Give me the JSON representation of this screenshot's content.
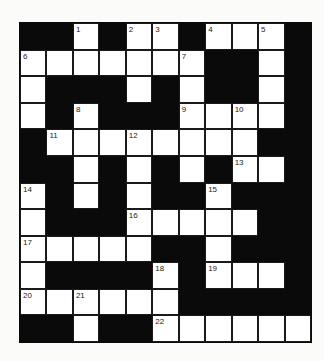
{
  "puzzle": {
    "type": "crossword",
    "columns": 11,
    "rows": 12,
    "colors": {
      "block": "#0a0a0a",
      "square": "#ffffff",
      "background": "#fbfbfa"
    },
    "layout": [
      "##.#..#...#",
      ".......##.#",
      ".###.#.##.#",
      ".#.###....#",
      "#........##",
      "##.#.#.#..#",
      ".#.#.##.###",
      ".###.....##",
      ".....##.###",
      ".####.#...#",
      "......#####",
      "##.##......"
    ],
    "numbers": [
      {
        "row": 0,
        "col": 2,
        "n": "1"
      },
      {
        "row": 0,
        "col": 4,
        "n": "2"
      },
      {
        "row": 0,
        "col": 5,
        "n": "3"
      },
      {
        "row": 0,
        "col": 7,
        "n": "4"
      },
      {
        "row": 0,
        "col": 9,
        "n": "5"
      },
      {
        "row": 1,
        "col": 0,
        "n": "6"
      },
      {
        "row": 1,
        "col": 6,
        "n": "7"
      },
      {
        "row": 3,
        "col": 2,
        "n": "8"
      },
      {
        "row": 3,
        "col": 6,
        "n": "9"
      },
      {
        "row": 3,
        "col": 8,
        "n": "10"
      },
      {
        "row": 4,
        "col": 1,
        "n": "11"
      },
      {
        "row": 4,
        "col": 4,
        "n": "12"
      },
      {
        "row": 5,
        "col": 8,
        "n": "13"
      },
      {
        "row": 6,
        "col": 0,
        "n": "14"
      },
      {
        "row": 6,
        "col": 7,
        "n": "15"
      },
      {
        "row": 7,
        "col": 4,
        "n": "16"
      },
      {
        "row": 8,
        "col": 0,
        "n": "17"
      },
      {
        "row": 9,
        "col": 5,
        "n": "18"
      },
      {
        "row": 9,
        "col": 7,
        "n": "19"
      },
      {
        "row": 10,
        "col": 0,
        "n": "20"
      },
      {
        "row": 10,
        "col": 2,
        "n": "21"
      },
      {
        "row": 11,
        "col": 5,
        "n": "22"
      }
    ]
  }
}
